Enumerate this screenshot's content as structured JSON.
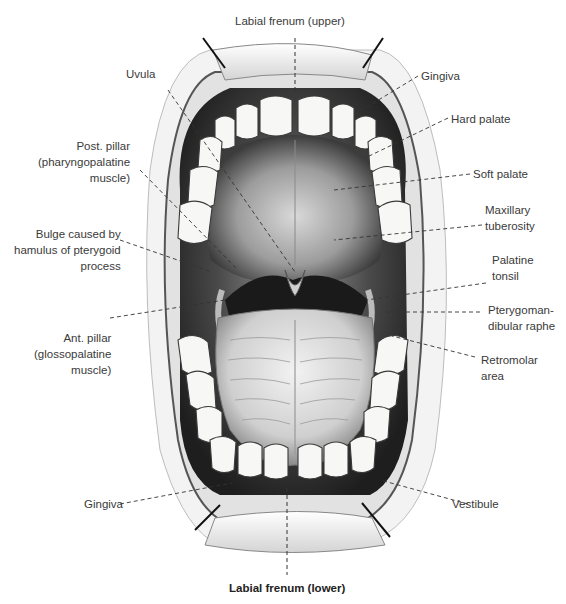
{
  "figure": {
    "caption": "Labial frenum (lower)"
  },
  "labels": {
    "labial_frenum_upper": "Labial frenum (upper)",
    "uvula": "Uvula",
    "post_pillar": [
      "Post. pillar",
      "(pharyngopalatine",
      "muscle)"
    ],
    "bulge_hamulus": [
      "Bulge caused by",
      "hamulus of pterygoid",
      "process"
    ],
    "ant_pillar": [
      "Ant. pillar",
      "(glossopalatine",
      "muscle)"
    ],
    "gingiva_lower": "Gingiva",
    "gingiva_upper": "Gingiva",
    "hard_palate": "Hard palate",
    "soft_palate": "Soft palate",
    "maxillary_tuberosity": [
      "Maxillary",
      "tuberosity"
    ],
    "palatine_tonsil": [
      "Palatine",
      "tonsil"
    ],
    "pterygomandibular_raphe": [
      "Pterygoman-",
      "dibular raphe"
    ],
    "retromolar_area": [
      "Retromolar",
      "area"
    ],
    "vestibule": "Vestibule"
  },
  "colors": {
    "ink": "#1a1a1a",
    "shade_dark": "#2b2b2b",
    "shade_mid": "#7a7a7a",
    "shade_light": "#d8d8d8",
    "tooth": "#f7f7f5",
    "label_text": "#3a3a3a"
  }
}
